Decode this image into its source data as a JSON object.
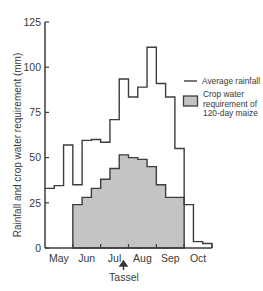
{
  "chart_data": {
    "type": "bar",
    "subtype": "step",
    "title": "",
    "xlabel": "",
    "ylabel": "Rainfall and crop water requirement (mm)",
    "ylim": [
      0,
      125
    ],
    "yticks": [
      0,
      25,
      50,
      75,
      100,
      125
    ],
    "grid": false,
    "x_unit": "dekad (10-day period)",
    "months": [
      "May",
      "Jun",
      "Jul",
      "Aug",
      "Sep",
      "Oct"
    ],
    "annotation": {
      "label": "Tassel",
      "position": "late July (between Jul and Aug)",
      "marker": "up-arrow"
    },
    "legend": {
      "position": "right",
      "entries": [
        {
          "label": "Average rainfall",
          "style": "line"
        },
        {
          "label": "Crop water requirement of 120-day maize",
          "style": "gray-filled-box"
        }
      ]
    },
    "categories": [
      "May-1",
      "May-2",
      "May-3",
      "Jun-1",
      "Jun-2",
      "Jun-3",
      "Jul-1",
      "Jul-2",
      "Jul-3",
      "Aug-1",
      "Aug-2",
      "Aug-3",
      "Sep-1",
      "Sep-2",
      "Sep-3",
      "Oct-1",
      "Oct-2",
      "Oct-3"
    ],
    "series": [
      {
        "name": "Average rainfall",
        "style": "step-line",
        "values": [
          33,
          34.5,
          57,
          35,
          59.5,
          60,
          58.5,
          71,
          93.5,
          83.5,
          89,
          111,
          91,
          83.5,
          55,
          24,
          3.5,
          2.5
        ]
      },
      {
        "name": "Crop water requirement of 120-day maize",
        "style": "filled-step",
        "values": [
          null,
          null,
          null,
          24,
          28,
          33,
          38,
          44,
          51.5,
          50,
          49,
          45,
          35,
          28,
          28,
          null,
          null,
          null
        ]
      }
    ]
  },
  "labels": {
    "y_axis_title": "Rainfall and crop water requirement (mm)",
    "tassel": "Tassel",
    "legend_rainfall": "Average rainfall",
    "legend_crop_line1": "Crop water",
    "legend_crop_line2": "requirement of",
    "legend_crop_line3": "120-day maize"
  },
  "colors": {
    "line": "#3d3d3d",
    "fill": "#c4c4c4",
    "text": "#3a3a3a",
    "background": "#ffffff"
  }
}
